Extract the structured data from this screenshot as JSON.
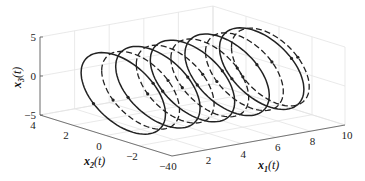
{
  "chart_data": {
    "type": "line",
    "subtype": "3d-trajectory",
    "title": "",
    "xlabel": "x1(t)",
    "ylabel": "x2(t)",
    "zlabel": "x3(t)",
    "axes": {
      "x1": {
        "label_main": "x",
        "label_sub": "1",
        "label_suffix": "(t)",
        "range": [
          0,
          10
        ],
        "ticks": [
          0,
          2,
          4,
          6,
          8,
          10
        ]
      },
      "x2": {
        "label_main": "x",
        "label_sub": "2",
        "label_suffix": "(t)",
        "range": [
          -4,
          4
        ],
        "ticks": [
          4,
          2,
          0,
          -2,
          -4
        ]
      },
      "x3": {
        "label_main": "x",
        "label_sub": "3",
        "label_suffix": "(t)",
        "range": [
          -5,
          5
        ],
        "ticks": [
          5,
          0,
          -5
        ]
      }
    },
    "grid": true,
    "legend": null,
    "series": [
      {
        "name": "trajectory-solid",
        "style": "solid",
        "description": "Helical/elliptical trajectory advancing along x1 from ~1 to ~9, 5 loops",
        "x1_centers": [
          1.0,
          3.0,
          5.0,
          7.0,
          9.0
        ],
        "x2_amplitude": 3.5,
        "x3_amplitude": 4.5
      },
      {
        "name": "trajectory-dashed",
        "style": "dashed",
        "description": "Companion trajectory offset ~1 unit along x1, 5 loops",
        "x1_centers": [
          2.0,
          4.0,
          6.0,
          8.0,
          9.5
        ],
        "x2_amplitude": 3.3,
        "x3_amplitude": 4.3
      }
    ]
  }
}
